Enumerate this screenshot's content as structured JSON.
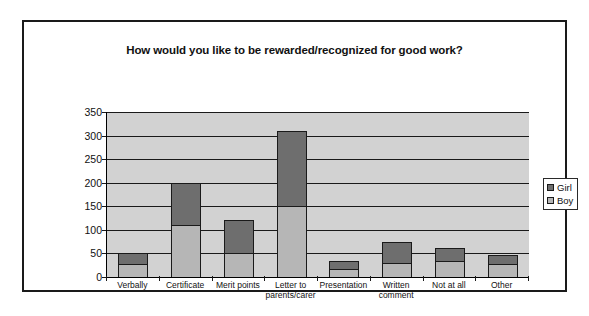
{
  "chart_data": {
    "type": "bar",
    "subtype": "stacked-vertical",
    "title": "How would you like to be rewarded/recognized for good work?",
    "xlabel": "",
    "ylabel": "",
    "ylim": [
      0,
      350
    ],
    "yticks": [
      0,
      50,
      100,
      150,
      200,
      250,
      300,
      350
    ],
    "ytick_labels": [
      "0",
      "50",
      "100",
      "150",
      "200",
      "250",
      "300",
      "350"
    ],
    "grid": true,
    "legend_position": "right",
    "categories": [
      "Verbally",
      "Certificate",
      "Merit points",
      "Letter to parents/carer",
      "Presentation",
      "Written comment",
      "Not at all",
      "Other"
    ],
    "category_label_lines": [
      [
        "Verbally"
      ],
      [
        "Certificate"
      ],
      [
        "Merit points"
      ],
      [
        "Letter to",
        "parents/carer"
      ],
      [
        "Presentation"
      ],
      [
        "Written",
        "comment"
      ],
      [
        "Not at all"
      ],
      [
        "Other"
      ]
    ],
    "series": [
      {
        "name": "Boy",
        "color": "#b6b6b6",
        "values": [
          28,
          110,
          50,
          150,
          17,
          30,
          33,
          28
        ]
      },
      {
        "name": "Girl",
        "color": "#6e6e6e",
        "values": [
          24,
          90,
          70,
          160,
          16,
          44,
          28,
          18
        ]
      }
    ],
    "totals": [
      52,
      200,
      120,
      310,
      33,
      74,
      61,
      46
    ]
  },
  "legend": {
    "items": [
      {
        "label": "Girl",
        "color": "#6e6e6e"
      },
      {
        "label": "Boy",
        "color": "#b6b6b6"
      }
    ]
  }
}
